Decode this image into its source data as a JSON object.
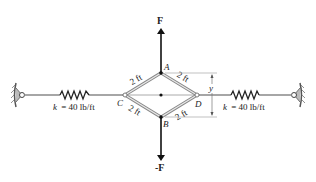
{
  "figure": {
    "forces": {
      "top": "F",
      "bottom": "-F"
    },
    "points": {
      "A": "A",
      "B": "B",
      "C": "C",
      "D": "D"
    },
    "members": {
      "AC": "2 ft",
      "AD": "2 ft",
      "CB": "2 ft",
      "BD": "2 ft"
    },
    "dimension": "y",
    "springs": {
      "left": {
        "k_label": "k = 40 lb/ft",
        "k_symbol": "k",
        "k_value": "= 40 lb/ft"
      },
      "right": {
        "k_label": "k = 40 lb/ft",
        "k_symbol": "k",
        "k_value": "= 40 lb/ft"
      }
    },
    "colors": {
      "line": "#222222",
      "rod": "#888888",
      "member": "#9a9a9a"
    }
  }
}
